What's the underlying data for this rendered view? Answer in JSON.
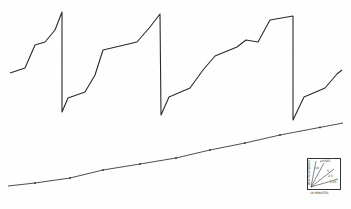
{
  "chart_data": {
    "type": "line",
    "title": "",
    "series": [
      {
        "name": "upper-trace",
        "points": [
          [
            10,
            73
          ],
          [
            25,
            68
          ],
          [
            35,
            45
          ],
          [
            45,
            42
          ],
          [
            55,
            30
          ],
          [
            62,
            12
          ],
          [
            62,
            112
          ],
          [
            68,
            98
          ],
          [
            85,
            92
          ],
          [
            95,
            75
          ],
          [
            103,
            50
          ],
          [
            120,
            46
          ],
          [
            137,
            42
          ],
          [
            150,
            27
          ],
          [
            160,
            14
          ],
          [
            161,
            115
          ],
          [
            169,
            97
          ],
          [
            190,
            88
          ],
          [
            203,
            70
          ],
          [
            215,
            56
          ],
          [
            237,
            47
          ],
          [
            246,
            40
          ],
          [
            258,
            42
          ],
          [
            270,
            20
          ],
          [
            293,
            16
          ],
          [
            293,
            120
          ],
          [
            304,
            97
          ],
          [
            325,
            88
          ],
          [
            337,
            74
          ],
          [
            342,
            70
          ]
        ]
      },
      {
        "name": "lower-baseline",
        "points": [
          [
            8,
            186
          ],
          [
            35,
            183
          ],
          [
            70,
            178
          ],
          [
            103,
            170
          ],
          [
            140,
            164
          ],
          [
            176,
            158
          ],
          [
            210,
            150
          ],
          [
            245,
            143
          ],
          [
            280,
            135
          ],
          [
            343,
            123
          ]
        ],
        "tick_marks_x": [
          35,
          70,
          103,
          140,
          176,
          210,
          245,
          280,
          320
        ]
      }
    ],
    "legend": {
      "type": "scale-inset",
      "y_label": "BED RESPONSES",
      "x_label": "10 MINUTES",
      "slope_labels": [
        "μV/SEC",
        "10",
        "5",
        "2.5",
        "1.25"
      ]
    },
    "xlabel": "",
    "ylabel": "",
    "grid": false
  }
}
